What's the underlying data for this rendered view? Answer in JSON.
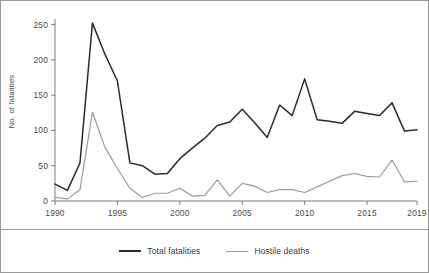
{
  "chart_data": {
    "type": "line",
    "title": "",
    "subtitle": "",
    "xlabel": "",
    "ylabel": "No. of fatalities",
    "x": [
      1990,
      1991,
      1992,
      1993,
      1994,
      1995,
      1996,
      1997,
      1998,
      1999,
      2000,
      2001,
      2002,
      2003,
      2004,
      2005,
      2006,
      2007,
      2008,
      2009,
      2010,
      2011,
      2012,
      2013,
      2014,
      2015,
      2016,
      2017,
      2018,
      2019
    ],
    "xlim": [
      1990,
      2019
    ],
    "ylim": [
      0,
      255
    ],
    "xticks": [
      1990,
      1995,
      2000,
      2005,
      2010,
      2015,
      2019
    ],
    "yticks": [
      0,
      50,
      100,
      150,
      200,
      250
    ],
    "xticklabels": [
      "1990",
      "1995",
      "2000",
      "2005",
      "2010",
      "2015",
      "2019"
    ],
    "yticklabels": [
      "0",
      "50",
      "100",
      "150",
      "200",
      "250"
    ],
    "grid": false,
    "legend_position": "bottom",
    "series": [
      {
        "name": "Total fatalities",
        "color": "#2b2b2b",
        "values": [
          24,
          15,
          54,
          252,
          208,
          170,
          54,
          50,
          38,
          39,
          60,
          75,
          89,
          107,
          112,
          130,
          111,
          90,
          136,
          121,
          173,
          115,
          113,
          110,
          127,
          124,
          121,
          139,
          99,
          101
        ]
      },
      {
        "name": "Hostile deaths",
        "color": "#9b9b9b",
        "values": [
          5,
          3,
          16,
          126,
          76,
          46,
          18,
          5,
          11,
          11,
          18,
          7,
          8,
          30,
          7,
          25,
          21,
          12,
          16,
          16,
          12,
          20,
          28,
          36,
          39,
          35,
          34,
          58,
          27,
          28
        ]
      }
    ]
  },
  "legend": {
    "entries": [
      {
        "label": "Total fatalities"
      },
      {
        "label": "Hostile deaths"
      }
    ]
  },
  "axes": {
    "ylabel": "No. of fatalities"
  },
  "colors": {
    "total_fatalities": "#2b2b2b",
    "hostile_deaths": "#9b9b9b",
    "axis": "#6f6f6f",
    "frame": "#9a9a9a",
    "text": "#4a4a4a",
    "background": "#ffffff"
  }
}
